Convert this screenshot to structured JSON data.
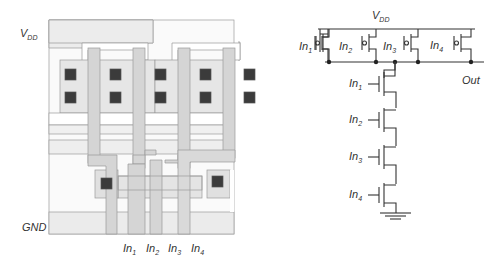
{
  "layout": {
    "supply_label": "V",
    "supply_sub": "DD",
    "ground_label": "GND",
    "inputs": [
      {
        "base": "In",
        "sub": "1"
      },
      {
        "base": "In",
        "sub": "2"
      },
      {
        "base": "In",
        "sub": "3"
      },
      {
        "base": "In",
        "sub": "4"
      }
    ],
    "colors": {
      "poly": "#d4d4d4",
      "metal": "#efefef",
      "diff": "#e4e4e4",
      "contact": "#3a3a3a",
      "outline": "#9a9a9a"
    }
  },
  "schematic": {
    "supply_label": "V",
    "supply_sub": "DD",
    "output_label": "Out",
    "pmos_inputs": [
      {
        "base": "In",
        "sub": "1"
      },
      {
        "base": "In",
        "sub": "2"
      },
      {
        "base": "In",
        "sub": "3"
      },
      {
        "base": "In",
        "sub": "4"
      }
    ],
    "nmos_inputs": [
      {
        "base": "In",
        "sub": "1"
      },
      {
        "base": "In",
        "sub": "2"
      },
      {
        "base": "In",
        "sub": "3"
      },
      {
        "base": "In",
        "sub": "4"
      }
    ],
    "colors": {
      "wire": "#333333"
    }
  }
}
